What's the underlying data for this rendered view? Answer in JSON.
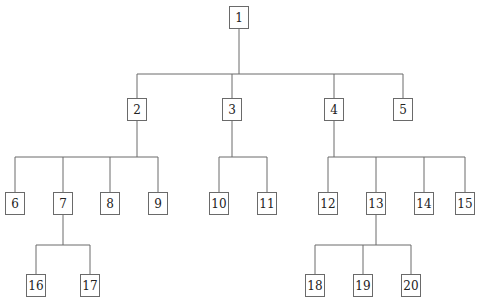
{
  "diagram": {
    "type": "tree",
    "nodes": [
      {
        "id": "1",
        "label": "1",
        "parent": null
      },
      {
        "id": "2",
        "label": "2",
        "parent": "1"
      },
      {
        "id": "3",
        "label": "3",
        "parent": "1"
      },
      {
        "id": "4",
        "label": "4",
        "parent": "1"
      },
      {
        "id": "5",
        "label": "5",
        "parent": "1"
      },
      {
        "id": "6",
        "label": "6",
        "parent": "2"
      },
      {
        "id": "7",
        "label": "7",
        "parent": "2"
      },
      {
        "id": "8",
        "label": "8",
        "parent": "2"
      },
      {
        "id": "9",
        "label": "9",
        "parent": "2"
      },
      {
        "id": "10",
        "label": "10",
        "parent": "3"
      },
      {
        "id": "11",
        "label": "11",
        "parent": "3"
      },
      {
        "id": "12",
        "label": "12",
        "parent": "4"
      },
      {
        "id": "13",
        "label": "13",
        "parent": "4"
      },
      {
        "id": "14",
        "label": "14",
        "parent": "4"
      },
      {
        "id": "15",
        "label": "15",
        "parent": "4"
      },
      {
        "id": "16",
        "label": "16",
        "parent": "7"
      },
      {
        "id": "17",
        "label": "17",
        "parent": "7"
      },
      {
        "id": "18",
        "label": "18",
        "parent": "13"
      },
      {
        "id": "19",
        "label": "19",
        "parent": "13"
      },
      {
        "id": "20",
        "label": "20",
        "parent": "13"
      }
    ]
  },
  "colors": {
    "line": "#6a6a6a",
    "box_border": "#6a6a6a",
    "text": "#222222"
  }
}
